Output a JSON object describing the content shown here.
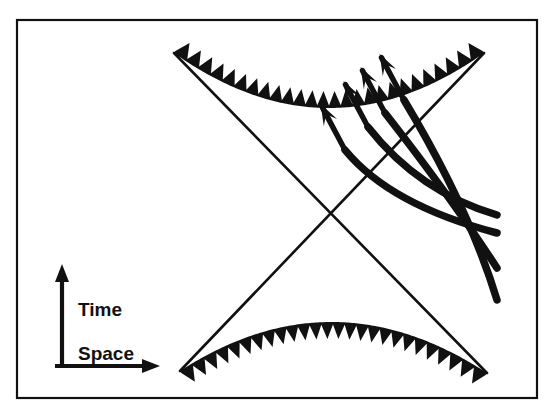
{
  "figure": {
    "background_color": "#ffffff",
    "ink_color": "#111111",
    "frame": {
      "name": "figure-border",
      "x": 17,
      "y": 20,
      "width": 520,
      "height": 378,
      "stroke_width": 2.2
    }
  },
  "legend": {
    "time_label": "Time",
    "space_label": "Space",
    "time_arrow": {
      "x": 62,
      "y_start": 366,
      "y_end": 266
    },
    "space_arrow": {
      "y": 366,
      "x_start": 55,
      "x_end": 160
    }
  },
  "singularities": [
    {
      "name": "future-singularity",
      "position": "top",
      "description": "jagged sawtooth hyperbola opening upward",
      "teeth": 26,
      "tooth_height": 17,
      "left_end": [
        174,
        53
      ],
      "right_end": [
        484,
        53
      ],
      "vertex": [
        329,
        108
      ]
    },
    {
      "name": "past-singularity",
      "position": "bottom",
      "description": "jagged sawtooth hyperbola opening downward",
      "teeth": 26,
      "tooth_height": 17,
      "left_end": [
        180,
        371
      ],
      "right_end": [
        487,
        373
      ],
      "vertex": [
        333,
        322
      ]
    }
  ],
  "horizons": [
    {
      "name": "horizon-line-up-right",
      "from": [
        174,
        53
      ],
      "to": [
        487,
        373
      ],
      "stroke_width": 2.6
    },
    {
      "name": "horizon-line-down-right",
      "from": [
        484,
        53
      ],
      "to": [
        180,
        371
      ],
      "stroke_width": 2.6
    }
  ],
  "crossing_point": [
    330,
    213
  ],
  "worldlines": {
    "count": 4,
    "description": "thick infalling world lines with arrowheads pointing up-left",
    "stroke_width": 7.5,
    "paths": [
      {
        "name": "worldline-1",
        "start": [
          345,
          150
        ],
        "control": [
          390,
          205
        ],
        "end": [
          497,
          233
        ]
      },
      {
        "name": "worldline-2",
        "start": [
          368,
          127
        ],
        "control": [
          419,
          192
        ],
        "end": [
          497,
          215
        ]
      },
      {
        "name": "worldline-3",
        "start": [
          385,
          113
        ],
        "control": [
          450,
          196
        ],
        "end": [
          497,
          268
        ]
      },
      {
        "name": "worldline-4",
        "start": [
          404,
          100
        ],
        "control": [
          469,
          208
        ],
        "end": [
          497,
          300
        ]
      }
    ],
    "arrow_angle_deg": 62
  },
  "chart_data": {
    "type": "scatter",
    "xlabel": "Space",
    "ylabel": "Time",
    "grid": false,
    "legend_position": "lower-left",
    "annotations": [
      "Upper jagged curve: future singularity",
      "Lower jagged curve: past singularity",
      "Two straight diagonals: event horizons crossing at center",
      "Four thick arrows: infalling world lines"
    ],
    "series": [
      {
        "name": "Time axis arrow",
        "values": []
      },
      {
        "name": "Space axis arrow",
        "values": []
      }
    ]
  }
}
